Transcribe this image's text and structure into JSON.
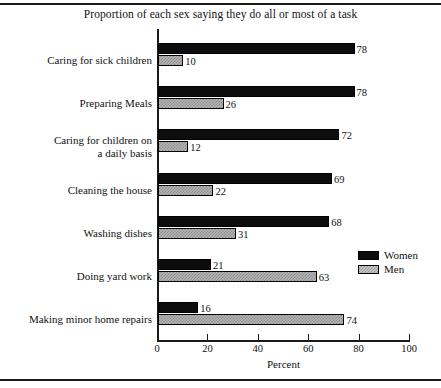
{
  "chart_data": {
    "type": "bar",
    "orientation": "horizontal",
    "title": "Proportion of each sex saying they do all or most of a task",
    "xlabel": "Percent",
    "ylabel": "",
    "xlim": [
      0,
      100
    ],
    "xticks": [
      0,
      20,
      40,
      60,
      80,
      100
    ],
    "xticklabels": [
      "0",
      "20",
      "40",
      "60",
      "80",
      "100"
    ],
    "grid": false,
    "legend_position": "right-middle",
    "categories": [
      "Caring for sick children",
      "Preparing Meals",
      "Caring for children on\na daily basis",
      "Cleaning the house",
      "Washing dishes",
      "Doing yard work",
      "Making minor home repairs"
    ],
    "series": [
      {
        "name": "Women",
        "color": "#0d0d0d",
        "values": [
          78,
          78,
          72,
          69,
          68,
          21,
          16
        ]
      },
      {
        "name": "Men",
        "color": "#b4b4b4",
        "values": [
          10,
          26,
          12,
          22,
          31,
          63,
          74
        ]
      }
    ]
  },
  "legend": {
    "items": [
      {
        "label": "Women"
      },
      {
        "label": "Men"
      }
    ]
  }
}
